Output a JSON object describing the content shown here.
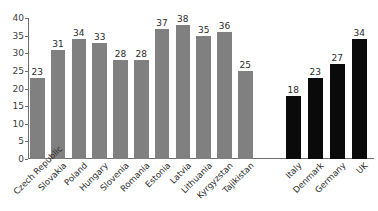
{
  "chart_data": {
    "type": "bar",
    "title": "",
    "subtitle": "",
    "xlabel": "",
    "ylabel": "",
    "ylim": [
      0,
      40
    ],
    "yticks": [
      0,
      5,
      10,
      15,
      20,
      25,
      30,
      35,
      40
    ],
    "grid": false,
    "legend": "none",
    "categories": [
      "Czech Republic",
      "Slovakia",
      "Poland",
      "Hungary",
      "Slovenia",
      "Romania",
      "Estonia",
      "Latvia",
      "Lithuania",
      "Kyrgyzstan",
      "Tajikistan",
      "Italy",
      "Denmark",
      "Germany",
      "UK"
    ],
    "values": [
      23,
      31,
      34,
      33,
      28,
      28,
      37,
      38,
      35,
      36,
      25,
      18,
      23,
      27,
      34
    ],
    "groups": [
      {
        "name": "transition-countries",
        "color": "#808080",
        "categories": [
          "Czech Republic",
          "Slovakia",
          "Poland",
          "Hungary",
          "Slovenia",
          "Romania",
          "Estonia",
          "Latvia",
          "Lithuania",
          "Kyrgyzstan",
          "Tajikistan"
        ],
        "values": [
          23,
          31,
          34,
          33,
          28,
          28,
          37,
          38,
          35,
          36,
          25
        ]
      },
      {
        "name": "western-countries",
        "color": "#0a0a0a",
        "categories": [
          "Italy",
          "Denmark",
          "Germany",
          "UK"
        ],
        "values": [
          18,
          23,
          27,
          34
        ]
      }
    ],
    "bars": [
      {
        "label": "Czech Republic",
        "value": 23,
        "color": "#808080"
      },
      {
        "label": "Slovakia",
        "value": 31,
        "color": "#808080"
      },
      {
        "label": "Poland",
        "value": 34,
        "color": "#808080"
      },
      {
        "label": "Hungary",
        "value": 33,
        "color": "#808080"
      },
      {
        "label": "Slovenia",
        "value": 28,
        "color": "#808080"
      },
      {
        "label": "Romania",
        "value": 28,
        "color": "#808080"
      },
      {
        "label": "Estonia",
        "value": 37,
        "color": "#808080"
      },
      {
        "label": "Latvia",
        "value": 38,
        "color": "#808080"
      },
      {
        "label": "Lithuania",
        "value": 35,
        "color": "#808080"
      },
      {
        "label": "Kyrgyzstan",
        "value": 36,
        "color": "#808080"
      },
      {
        "label": "Tajikistan",
        "value": 25,
        "color": "#808080"
      },
      {
        "label": "Italy",
        "value": 18,
        "color": "#0a0a0a"
      },
      {
        "label": "Denmark",
        "value": 23,
        "color": "#0a0a0a"
      },
      {
        "label": "Germany",
        "value": 27,
        "color": "#0a0a0a"
      },
      {
        "label": "UK",
        "value": 34,
        "color": "#0a0a0a"
      }
    ]
  },
  "colors": {
    "bar_gray": "#808080",
    "bar_black": "#0a0a0a",
    "axis": "#6f6f6f",
    "text": "#2b2b2b",
    "background": "#ffffff"
  }
}
